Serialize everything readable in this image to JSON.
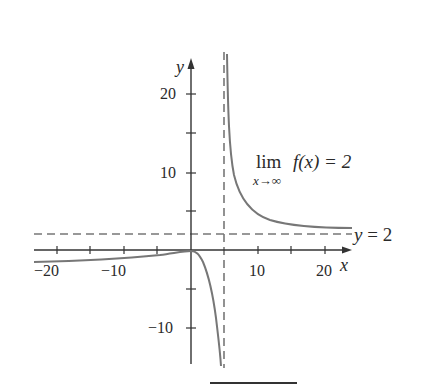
{
  "chart_data": {
    "type": "line",
    "title": "",
    "xlabel": "x",
    "ylabel": "y",
    "xlim": [
      -23,
      24
    ],
    "ylim": [
      -14,
      25
    ],
    "x_ticks": [
      -20,
      -15,
      -10,
      -5,
      5,
      10,
      15,
      20
    ],
    "x_tick_labels": [
      "−20",
      "−10",
      "10",
      "20"
    ],
    "x_tick_label_values": [
      -20,
      -10,
      10,
      20
    ],
    "y_ticks": [
      -10,
      -5,
      5,
      10,
      15,
      20
    ],
    "y_tick_labels": [
      "−10",
      "10",
      "20"
    ],
    "y_tick_label_values": [
      -10,
      10,
      20
    ],
    "grid": false,
    "series": [
      {
        "name": "f(x) left branch",
        "style": "solid",
        "color": "#777777",
        "x": [
          -23,
          -20,
          -15,
          -10,
          -5,
          -2,
          0,
          1,
          2,
          3,
          3.5,
          4,
          4.4
        ],
        "y": [
          -1.6,
          -1.5,
          -1.2,
          -0.9,
          -0.5,
          -0.2,
          0,
          -0.5,
          -2,
          -5,
          -7.5,
          -11,
          -14
        ]
      },
      {
        "name": "f(x) right branch",
        "style": "solid",
        "color": "#777777",
        "x": [
          5.4,
          5.6,
          6,
          6.5,
          7,
          8,
          9,
          10,
          12,
          14,
          17,
          20,
          22.5
        ],
        "y": [
          24.5,
          20,
          14,
          10,
          7.5,
          5.5,
          4.6,
          4.0,
          3.4,
          3.0,
          2.8,
          2.7,
          2.6
        ]
      }
    ],
    "asymptotes": [
      {
        "type": "vertical",
        "x": 5,
        "style": "dashed"
      },
      {
        "type": "horizontal",
        "y": 2,
        "style": "dashed",
        "label": "y = 2"
      }
    ],
    "annotations": [
      {
        "text": "lim f(x) = 2",
        "subscript": "x→∞"
      },
      {
        "text": "y = 2"
      }
    ]
  },
  "labels": {
    "y_axis": "y",
    "x_axis": "x",
    "y20": "20",
    "y10": "10",
    "yneg10": "−10",
    "xneg20": "−20",
    "xneg10": "−10",
    "x10": "10",
    "x20": "20",
    "lim_main": "lim",
    "lim_func": "f(x) = 2",
    "lim_sub": "x→∞",
    "asym_label": "y = 2"
  }
}
